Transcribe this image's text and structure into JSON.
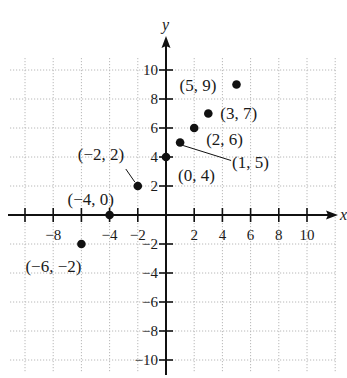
{
  "chart_data": {
    "type": "scatter",
    "title": "",
    "xlabel": "x",
    "ylabel": "y",
    "xlim": [
      -11,
      12
    ],
    "ylim": [
      -11,
      11
    ],
    "grid": true,
    "grid_step": 2,
    "x_ticks": [
      -10,
      -8,
      -6,
      -4,
      -2,
      2,
      4,
      6,
      8,
      10
    ],
    "x_tick_labels": [
      "-8",
      "-4",
      "-2",
      "2",
      "4",
      "6",
      "8",
      "10"
    ],
    "x_tick_label_values": [
      -8,
      -4,
      -2,
      2,
      4,
      6,
      8,
      10
    ],
    "y_ticks": [
      -10,
      -8,
      -6,
      -4,
      -2,
      2,
      4,
      6,
      8,
      10
    ],
    "y_tick_labels": [
      "-10",
      "-8",
      "-6",
      "-4",
      "-2",
      "2",
      "4",
      "6",
      "8",
      "10"
    ],
    "y_tick_label_values": [
      -10,
      -8,
      -6,
      -4,
      -2,
      2,
      4,
      6,
      8,
      10
    ],
    "points": [
      {
        "x": -6,
        "y": -2,
        "label": "(−6, −2)"
      },
      {
        "x": -4,
        "y": 0,
        "label": "(−4, 0)"
      },
      {
        "x": -2,
        "y": 2,
        "label": "(−2, 2)"
      },
      {
        "x": 0,
        "y": 4,
        "label": "(0, 4)"
      },
      {
        "x": 1,
        "y": 5,
        "label": "(1, 5)"
      },
      {
        "x": 2,
        "y": 6,
        "label": "(2, 6)"
      },
      {
        "x": 3,
        "y": 7,
        "label": "(3, 7)"
      },
      {
        "x": 5,
        "y": 9,
        "label": "(5, 9)"
      }
    ]
  },
  "colors": {
    "axis": "#111111",
    "grid": "#b8b8b8",
    "point": "#111111",
    "background": "#ffffff"
  }
}
